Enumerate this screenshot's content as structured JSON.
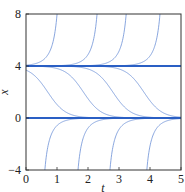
{
  "chart_data": {
    "type": "line",
    "title": "",
    "xlabel": "t",
    "ylabel": "x",
    "xlim": [
      0,
      5
    ],
    "ylim": [
      -4,
      8
    ],
    "xticks": [
      "0",
      "1",
      "2",
      "3",
      "4",
      "5"
    ],
    "yticks": [
      "-4",
      "0",
      "4",
      "8"
    ],
    "grid": false,
    "legend": null,
    "equilibria": [
      0,
      4
    ],
    "rate": 3.5,
    "series": [
      {
        "name": "equilibrium x=4",
        "kind": "constant",
        "value": 4
      },
      {
        "name": "equilibrium x=0",
        "kind": "constant",
        "value": 0
      },
      {
        "name": "upper 1",
        "kind": "blowup",
        "t_blow": 1.2,
        "reaches_8_at": 1.0
      },
      {
        "name": "upper 2",
        "kind": "blowup",
        "t_blow": 2.49,
        "reaches_8_at": 2.29
      },
      {
        "name": "upper 3",
        "kind": "blowup",
        "t_blow": 3.43,
        "reaches_8_at": 3.23
      },
      {
        "name": "upper 4",
        "kind": "blowup",
        "t_blow": 4.52,
        "reaches_8_at": 4.32
      },
      {
        "name": "middle 1",
        "kind": "decay_4_to_0",
        "t_mid": 0.7
      },
      {
        "name": "middle 2",
        "kind": "decay_4_to_0",
        "t_mid": 1.85
      },
      {
        "name": "middle 3",
        "kind": "decay_4_to_0",
        "t_mid": 2.8
      },
      {
        "name": "middle 4",
        "kind": "decay_4_to_0",
        "t_mid": 3.8
      },
      {
        "name": "lower 1",
        "kind": "rise_to_0",
        "t_start": 0.41,
        "enters_at_minus4": 0.61
      },
      {
        "name": "lower 2",
        "kind": "rise_to_0",
        "t_start": 1.48,
        "enters_at_minus4": 1.68
      },
      {
        "name": "lower 3",
        "kind": "rise_to_0",
        "t_start": 2.51,
        "enters_at_minus4": 2.71
      },
      {
        "name": "lower 4",
        "kind": "rise_to_0",
        "t_start": 3.7,
        "enters_at_minus4": 3.9
      }
    ]
  },
  "colors": {
    "curve": "#6b8fd6",
    "equilibrium": "#2a5fc4",
    "axes": "#333333",
    "text": "#222222"
  },
  "layout": {
    "plot_left": 26,
    "plot_right": 181,
    "plot_top": 14,
    "plot_bottom": 170
  }
}
